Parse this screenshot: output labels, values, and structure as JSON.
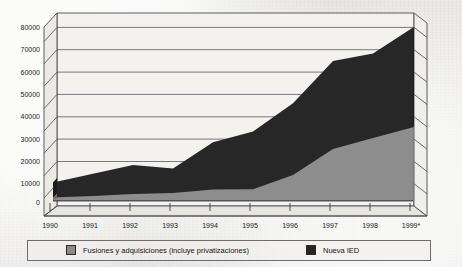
{
  "chart_data": {
    "type": "area",
    "stacked": true,
    "title": "",
    "subtitle": "",
    "xlabel": "",
    "ylabel": "",
    "categories": [
      "1990",
      "1991",
      "1992",
      "1993",
      "1994",
      "1995",
      "1996",
      "1997",
      "1998",
      "1999*"
    ],
    "series": [
      {
        "name": "Fusiones y adquisiciones (incluye privatizaciones)",
        "color": "#8a8a8a",
        "values": [
          1500,
          2200,
          3200,
          3600,
          5200,
          5400,
          12000,
          24000,
          29000,
          34000
        ]
      },
      {
        "name": "Nueva IED",
        "color": "#262626",
        "values": [
          7000,
          10300,
          13300,
          11400,
          21800,
          26600,
          33000,
          40500,
          39000,
          46000
        ]
      }
    ],
    "totals": [
      8500,
      12500,
      16500,
      15000,
      27000,
      32000,
      45000,
      64500,
      68000,
      80000
    ],
    "ylim": [
      0,
      80000
    ],
    "ytick_values": [
      0,
      10000,
      20000,
      30000,
      40000,
      50000,
      60000,
      70000,
      80000
    ],
    "ytick_labels": [
      "0",
      "10000",
      "20000",
      "30000",
      "40000",
      "50000",
      "60000",
      "70000",
      "80000"
    ],
    "grid": true,
    "legend_position": "bottom",
    "three_d": true
  },
  "legend": {
    "items": [
      {
        "label": "Fusiones y adquisiciones (incluye privatizaciones)",
        "color": "#8a8a8a"
      },
      {
        "label": "Nueva IED",
        "color": "#262626"
      }
    ]
  },
  "axis": {
    "y_labels": [
      "80000",
      "70000",
      "60000",
      "50000",
      "40000",
      "30000",
      "20000",
      "10000",
      "0"
    ],
    "x_labels": [
      "1990",
      "1991",
      "1992",
      "1993",
      "1994",
      "1995",
      "1996",
      "1997",
      "1998",
      "1999*"
    ]
  },
  "colors": {
    "series_mna": "#8a8a8a",
    "series_fdi": "#262626",
    "grid": "#55555a",
    "axis": "#3a3a3a",
    "wall": "#f2f1ee",
    "background": "#e9e8e5",
    "text": "#1b1b1b"
  }
}
